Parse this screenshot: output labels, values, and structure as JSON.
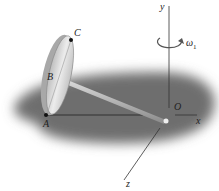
{
  "diagram": {
    "type": "mechanics-rigid-body",
    "labels": {
      "point_c": "C",
      "point_b": "B",
      "point_a": "A",
      "origin": "O",
      "axis_x": "x",
      "axis_y": "y",
      "axis_z": "z",
      "omega": "ω",
      "omega_sub": "1"
    },
    "colors": {
      "shadow": "#6e6e6e",
      "disk_face": "#d8d8d8",
      "disk_rim": "#a8a8a8",
      "rod": "#b0b0b0",
      "lines": "#333333"
    }
  }
}
